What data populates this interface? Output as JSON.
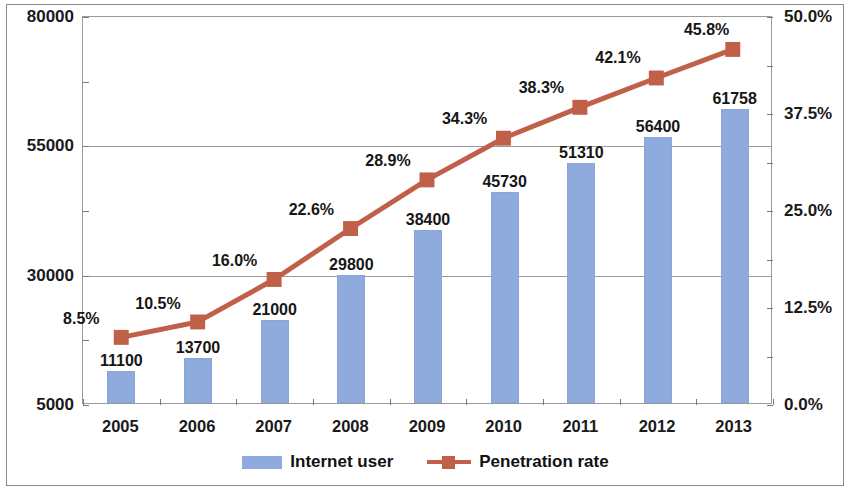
{
  "chart_data": {
    "type": "bar",
    "title": "",
    "subtitle": "",
    "xlabel": "",
    "ylabel": "",
    "categories": [
      "2005",
      "2006",
      "2007",
      "2008",
      "2009",
      "2010",
      "2011",
      "2012",
      "2013"
    ],
    "series": [
      {
        "name": "Internet user",
        "type": "bar",
        "axis": "left",
        "color": "#8FAADC",
        "values": [
          11100,
          13700,
          21000,
          29800,
          38400,
          45730,
          51310,
          56400,
          61758
        ],
        "labels": [
          "11100",
          "13700",
          "21000",
          "29800",
          "38400",
          "45730",
          "51310",
          "56400",
          "61758"
        ]
      },
      {
        "name": "Penetration rate",
        "type": "line",
        "axis": "right",
        "color": "#C0604A",
        "marker": "square",
        "values": [
          8.5,
          10.5,
          16.0,
          22.6,
          28.9,
          34.3,
          38.3,
          42.1,
          45.8
        ],
        "labels": [
          "8.5%",
          "10.5%",
          "16.0%",
          "22.6%",
          "28.9%",
          "34.3%",
          "38.3%",
          "42.1%",
          "45.8%"
        ]
      }
    ],
    "left_axis": {
      "ticks": [
        5000,
        30000,
        55000,
        80000
      ],
      "tick_labels": [
        "5000",
        "30000",
        "55000",
        "80000"
      ],
      "ylim": [
        5000,
        80000
      ]
    },
    "right_axis": {
      "ticks": [
        0.0,
        12.5,
        25.0,
        37.5,
        50.0
      ],
      "tick_labels": [
        "0.0%",
        "12.5%",
        "25.0%",
        "37.5%",
        "50.0%"
      ],
      "ylim": [
        0,
        50
      ]
    },
    "grid": {
      "horizontal": true,
      "values": [
        30000,
        55000
      ]
    },
    "legend": {
      "position": "bottom",
      "entries": [
        "Internet user",
        "Penetration rate"
      ]
    }
  }
}
